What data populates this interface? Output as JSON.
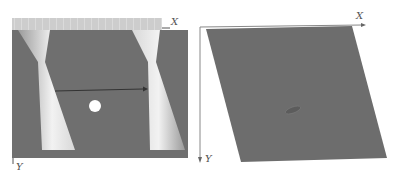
{
  "figure": {
    "panels": [
      {
        "id": "left",
        "description": "Rectangular gray domain with two hourglass-shaped light bands, a horizontal arrow and a white circular inclusion",
        "x_axis_label": "X",
        "y_axis_label": "Y",
        "colors": {
          "domain": "#6f6f6f",
          "band": "#e8e8e8",
          "strip": "#c8c8c8",
          "inclusion": "#ffffff",
          "arrow": "#333333"
        }
      },
      {
        "id": "right",
        "description": "Sheared parallelogram domain with a small elliptical inclusion",
        "x_axis_label": "X",
        "y_axis_label": "Y",
        "colors": {
          "domain": "#6d6d6d",
          "inclusion": "#5a5a5a",
          "axis": "#777777"
        }
      }
    ]
  }
}
